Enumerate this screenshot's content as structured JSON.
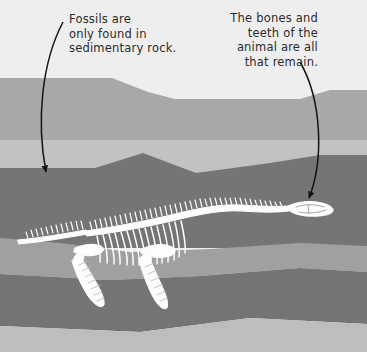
{
  "illustration": {
    "title": "Fossil preserved in sedimentary rock",
    "subject": "plesiosaur-skeleton",
    "background_color": "#eeeeee"
  },
  "annotations": [
    {
      "id": "left",
      "text": "Fossils are\nonly found in\nsedimentary rock.",
      "align": "left",
      "arrow_name": "arrow-to-rock-layer"
    },
    {
      "id": "right",
      "text": "The bones and\nteeth of the\nanimal are all\nthat remain.",
      "align": "right",
      "arrow_name": "arrow-to-skull"
    }
  ],
  "strata": [
    {
      "name": "stratum-sky-top",
      "color": "#eeeeee"
    },
    {
      "name": "stratum-medium-gray-upper",
      "color": "#a8a8a8"
    },
    {
      "name": "stratum-light-gray-band",
      "color": "#c2c2c2"
    },
    {
      "name": "stratum-dark-gray-main",
      "color": "#757575"
    },
    {
      "name": "stratum-medium-gray-mid",
      "color": "#a0a0a0"
    },
    {
      "name": "stratum-dark-gray-lower",
      "color": "#747474"
    },
    {
      "name": "stratum-light-gray-bottom",
      "color": "#bdbdbd"
    }
  ],
  "fossil": {
    "name": "plesiosaur-skeleton",
    "bone_color": "#fdfdfd",
    "parts": [
      "skull",
      "neck-vertebrae",
      "spine",
      "ribcage",
      "tail",
      "front-flipper",
      "rear-flipper",
      "pectoral-girdle",
      "pelvic-girdle"
    ]
  },
  "arrows": {
    "stroke_color": "#141414",
    "stroke_width": 1.6
  }
}
